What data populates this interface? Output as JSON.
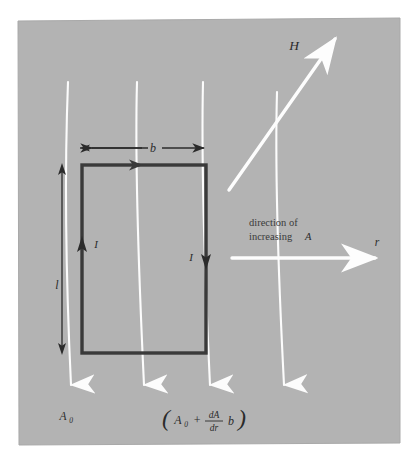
{
  "figure": {
    "panel": {
      "background_color": "#b3b3b3",
      "page_color": "#ffffff",
      "x": 18,
      "y": 18,
      "width": 382,
      "height": 427
    },
    "colors": {
      "flux_line": "#fcfcfc",
      "loop_outline": "#3a3a3a",
      "dimension_arrow": "#2b2b2b",
      "label_text": "#2b2b2b",
      "field_arrow": "#fdfdfd"
    }
  },
  "labels": {
    "field_vector": "H",
    "radial_axis": "r",
    "width_dimension": "b",
    "length_dimension": "l",
    "current_left": "I",
    "current_right": "I",
    "direction_line1": "direction of",
    "direction_line2": "increasing",
    "direction_symbol": "A",
    "vector_potential_near": "A",
    "vector_potential_near_sub": "0",
    "expression": {
      "open_paren": "(",
      "term1": "A",
      "term1_sub": "0",
      "plus": "+",
      "numerator": "dA",
      "denominator": "dr",
      "term2": "b",
      "close_paren": ")"
    }
  },
  "geometry": {
    "loop": {
      "x": 82,
      "y": 165,
      "width": 124,
      "height": 188
    },
    "flux_lines": [
      {
        "top_x": 68,
        "top_y": 82,
        "bottom_x": 72,
        "bottom_y": 398
      },
      {
        "top_x": 137,
        "top_y": 82,
        "bottom_x": 145,
        "bottom_y": 398
      },
      {
        "top_x": 203,
        "top_y": 82,
        "bottom_x": 211,
        "bottom_y": 398
      },
      {
        "top_x": 278,
        "top_y": 92,
        "bottom_x": 285,
        "bottom_y": 398
      }
    ],
    "field_arrow": {
      "x1": 229,
      "y1": 190,
      "x2": 337,
      "y2": 37
    },
    "radial_arrow": {
      "x1": 232,
      "y1": 258,
      "x2": 378,
      "y2": 258
    },
    "width_dimension": {
      "x1": 82,
      "x2": 196,
      "y": 148
    },
    "length_dimension": {
      "x": 62,
      "y1": 165,
      "y2": 353
    }
  }
}
